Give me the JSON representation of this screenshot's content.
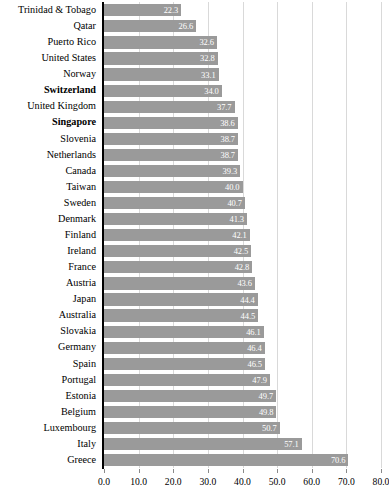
{
  "chart_data": {
    "type": "bar",
    "orientation": "horizontal",
    "title": "",
    "subtitle": "",
    "xlabel": "",
    "ylabel": "",
    "xlim": [
      0.0,
      80.0
    ],
    "xticks": [
      "0.0",
      "10.0",
      "20.0",
      "30.0",
      "40.0",
      "50.0",
      "60.0",
      "70.0",
      "80.0"
    ],
    "xtick_values": [
      0,
      10,
      20,
      30,
      40,
      50,
      60,
      70,
      80
    ],
    "grid": "vertical",
    "legend": "none",
    "bar_color": "#9a9a9a",
    "value_label_color": "#ffffff",
    "axis_color": "#000000",
    "gridline_color": "#d9d9d9",
    "categories": [
      "Trinidad & Tobago",
      "Qatar",
      "Puerto Rico",
      "United States",
      "Norway",
      "Switzerland",
      "United Kingdom",
      "Singapore",
      "Slovenia",
      "Netherlands",
      "Canada",
      "Taiwan",
      "Sweden",
      "Denmark",
      "Finland",
      "Ireland",
      "France",
      "Austria",
      "Japan",
      "Australia",
      "Slovakia",
      "Germany",
      "Spain",
      "Portugal",
      "Estonia",
      "Belgium",
      "Luxembourg",
      "Italy",
      "Greece"
    ],
    "values": [
      22.3,
      26.6,
      32.6,
      32.8,
      33.1,
      34.0,
      37.7,
      38.6,
      38.7,
      38.7,
      39.3,
      40.0,
      40.7,
      41.3,
      42.1,
      42.5,
      42.8,
      43.6,
      44.4,
      44.5,
      46.1,
      46.4,
      46.5,
      47.9,
      49.7,
      49.8,
      50.7,
      57.1,
      70.6
    ],
    "value_labels": [
      "22.3",
      "26.6",
      "32.6",
      "32.8",
      "33.1",
      "34.0",
      "37.7",
      "38.6",
      "38.7",
      "38.7",
      "39.3",
      "40.0",
      "40.7",
      "41.3",
      "42.1",
      "42.5",
      "42.8",
      "43.6",
      "44.4",
      "44.5",
      "46.1",
      "46.4",
      "46.5",
      "47.9",
      "49.7",
      "49.8",
      "50.7",
      "57.1",
      "70.6"
    ],
    "emphasized_categories": [
      "Switzerland",
      "Singapore"
    ]
  }
}
